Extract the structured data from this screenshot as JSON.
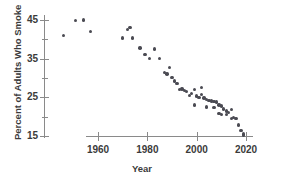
{
  "chart_data": {
    "type": "scatter",
    "title": "",
    "xlabel": "Year",
    "ylabel": "Percent of Adults Who Smoke",
    "xlim": [
      1943,
      2023
    ],
    "ylim": [
      14,
      46.5
    ],
    "xticks": [
      1960,
      1980,
      2000,
      2020
    ],
    "xtick_labels": [
      "1960",
      "1980",
      "2000",
      "2020"
    ],
    "yticks": [
      15,
      20,
      25,
      30,
      35,
      40,
      45
    ],
    "ytick_labels": [
      "15",
      "",
      "25",
      "",
      "35",
      "",
      "45"
    ],
    "ytick_major": [
      15,
      25,
      35,
      45
    ],
    "grid": false,
    "legend": false,
    "marker_color": "#4a4a52",
    "axis_color": "#8a8a8a",
    "text_color": "#3b3b3b",
    "points": [
      {
        "x": 1946,
        "y": 41.0
      },
      {
        "x": 1951,
        "y": 44.8
      },
      {
        "x": 1954,
        "y": 45.0
      },
      {
        "x": 1957,
        "y": 42.0
      },
      {
        "x": 1970,
        "y": 40.3
      },
      {
        "x": 1972,
        "y": 42.5
      },
      {
        "x": 1973,
        "y": 43.0
      },
      {
        "x": 1974,
        "y": 40.3
      },
      {
        "x": 1977,
        "y": 37.8
      },
      {
        "x": 1979,
        "y": 36.0
      },
      {
        "x": 1981,
        "y": 35.0
      },
      {
        "x": 1983,
        "y": 37.5
      },
      {
        "x": 1985,
        "y": 35.0
      },
      {
        "x": 1987,
        "y": 31.5
      },
      {
        "x": 1988,
        "y": 31.0
      },
      {
        "x": 1989,
        "y": 32.7
      },
      {
        "x": 1990,
        "y": 30.2
      },
      {
        "x": 1991,
        "y": 29.2
      },
      {
        "x": 1992,
        "y": 28.5
      },
      {
        "x": 1993,
        "y": 27.0
      },
      {
        "x": 1994,
        "y": 27.2
      },
      {
        "x": 1995,
        "y": 26.8
      },
      {
        "x": 1996,
        "y": 26.5
      },
      {
        "x": 1997,
        "y": 25.5
      },
      {
        "x": 1998,
        "y": 26.0
      },
      {
        "x": 1999,
        "y": 27.0
      },
      {
        "x": 1999,
        "y": 23.0
      },
      {
        "x": 2000,
        "y": 25.3
      },
      {
        "x": 2001,
        "y": 25.0
      },
      {
        "x": 2002,
        "y": 27.5
      },
      {
        "x": 2002,
        "y": 25.8
      },
      {
        "x": 2003,
        "y": 24.8
      },
      {
        "x": 2004,
        "y": 24.5
      },
      {
        "x": 2004,
        "y": 22.5
      },
      {
        "x": 2005,
        "y": 24.2
      },
      {
        "x": 2006,
        "y": 24.2
      },
      {
        "x": 2006,
        "y": 24.0
      },
      {
        "x": 2007,
        "y": 24.0
      },
      {
        "x": 2007,
        "y": 22.3
      },
      {
        "x": 2008,
        "y": 23.8
      },
      {
        "x": 2009,
        "y": 23.0
      },
      {
        "x": 2009,
        "y": 20.8
      },
      {
        "x": 2010,
        "y": 22.8
      },
      {
        "x": 2010,
        "y": 20.5
      },
      {
        "x": 2011,
        "y": 22.0
      },
      {
        "x": 2012,
        "y": 21.5
      },
      {
        "x": 2012,
        "y": 20.5
      },
      {
        "x": 2013,
        "y": 21.0
      },
      {
        "x": 2014,
        "y": 21.8
      },
      {
        "x": 2014,
        "y": 19.5
      },
      {
        "x": 2015,
        "y": 19.8
      },
      {
        "x": 2016,
        "y": 19.5
      },
      {
        "x": 2017,
        "y": 17.8
      },
      {
        "x": 2018,
        "y": 16.5
      },
      {
        "x": 2019,
        "y": 15.5
      },
      {
        "x": 2019,
        "y": 15.2
      }
    ]
  }
}
